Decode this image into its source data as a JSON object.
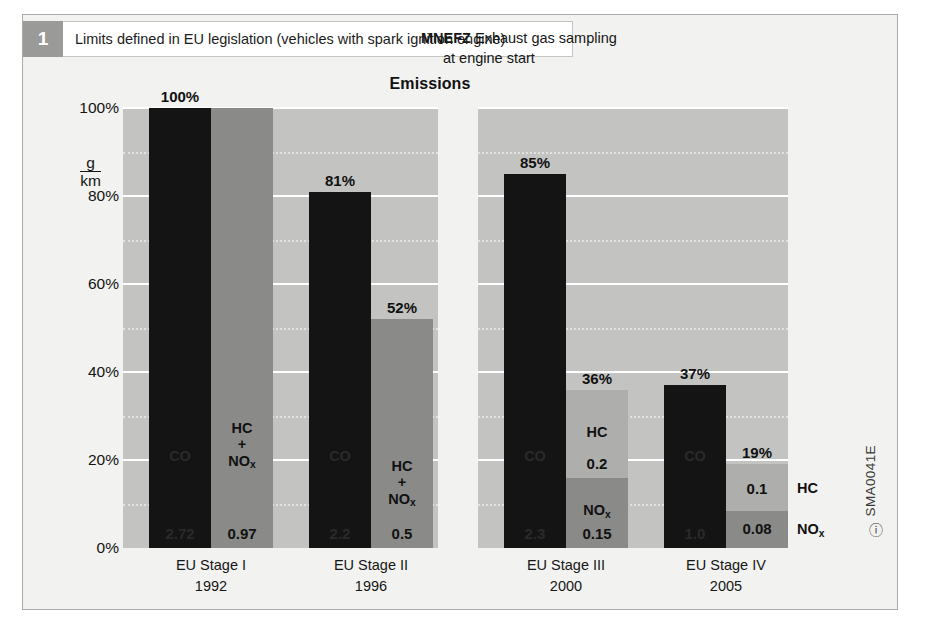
{
  "header": {
    "badge": "1",
    "title": "Limits defined in EU legislation (vehicles with spark ignition engine)"
  },
  "annotation": {
    "lead": "MNEFZ",
    "line1": "Exhaust gas sampling",
    "line2": "at engine start"
  },
  "caption": {
    "code": "SMA0041E",
    "mark": "ⓘ"
  },
  "chart_data": {
    "type": "bar",
    "title": "Emissions",
    "xlabel": "",
    "ylabel": "g/km",
    "ylim": [
      0,
      100
    ],
    "grid": true,
    "legend": "none",
    "ytick_labels": [
      "100%",
      "80%",
      "60%",
      "40%",
      "20%",
      "0%"
    ],
    "ytick_values": [
      100,
      80,
      60,
      40,
      20,
      0
    ],
    "unit_numerator": "g",
    "unit_denominator": "km",
    "categories": [
      "EU Stage I",
      "EU Stage II",
      "EU Stage III",
      "EU Stage IV"
    ],
    "category_years": [
      "1992",
      "1996",
      "2000",
      "2005"
    ],
    "groups": [
      {
        "category": "EU Stage I",
        "year": "1992",
        "bars": [
          {
            "top_label": "100%",
            "total_percent": 100,
            "segments": [
              {
                "name": "CO",
                "value": "2.72",
                "percent": 100,
                "shade": "dark"
              }
            ]
          },
          {
            "top_label": "",
            "total_percent": 100,
            "segments": [
              {
                "name": "HC\n+\nNOx",
                "value": "0.97",
                "percent": 100,
                "shade": "mid"
              }
            ]
          }
        ]
      },
      {
        "category": "EU Stage II",
        "year": "1996",
        "bars": [
          {
            "top_label": "81%",
            "total_percent": 81,
            "segments": [
              {
                "name": "CO",
                "value": "2.2",
                "percent": 81,
                "shade": "dark"
              }
            ]
          },
          {
            "top_label": "52%",
            "total_percent": 52,
            "segments": [
              {
                "name": "HC\n+\nNOx",
                "value": "0.5",
                "percent": 52,
                "shade": "mid"
              }
            ]
          }
        ]
      },
      {
        "category": "EU Stage III",
        "year": "2000",
        "bars": [
          {
            "top_label": "85%",
            "total_percent": 85,
            "segments": [
              {
                "name": "CO",
                "value": "2.3",
                "percent": 85,
                "shade": "dark"
              }
            ]
          },
          {
            "top_label": "36%",
            "total_percent": 36,
            "segments": [
              {
                "name": "HC",
                "value": "0.2",
                "percent": 20,
                "shade": "light"
              },
              {
                "name": "NOx",
                "value": "0.15",
                "percent": 16,
                "shade": "mid"
              }
            ]
          }
        ]
      },
      {
        "category": "EU Stage IV",
        "year": "2005",
        "bars": [
          {
            "top_label": "37%",
            "total_percent": 37,
            "segments": [
              {
                "name": "CO",
                "value": "1.0",
                "percent": 37,
                "shade": "dark"
              }
            ]
          },
          {
            "top_label": "19%",
            "total_percent": 19,
            "segments": [
              {
                "name": "HC",
                "value": "0.1",
                "percent": 10.5,
                "shade": "light",
                "label_outside": true
              },
              {
                "name": "NOx",
                "value": "0.08",
                "percent": 8.5,
                "shade": "mid",
                "label_outside": true
              }
            ]
          }
        ]
      }
    ]
  },
  "colors": {
    "panel": "#c3c3c1",
    "bar_dark": "#141414",
    "bar_mid": "#8a8a88",
    "bar_light": "#aeaeac",
    "badge": "#9a9a98",
    "gridline": "#ffffff",
    "page": "#f2f2f0"
  }
}
